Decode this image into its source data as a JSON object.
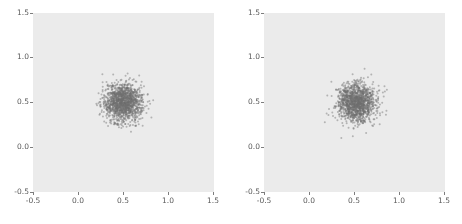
{
  "figure": {
    "background_color": "#ffffff",
    "width": 462,
    "height": 224,
    "layout": "1x2 side-by-side scatter subplots"
  },
  "chart_data": [
    {
      "type": "scatter",
      "title": "",
      "subtitle": "",
      "xlabel": "",
      "ylabel": "",
      "xlim": [
        -0.5,
        1.5
      ],
      "ylim": [
        -0.5,
        1.5
      ],
      "xticks": [
        -0.5,
        0.0,
        0.5,
        1.0,
        1.5
      ],
      "yticks": [
        -0.5,
        0.0,
        0.5,
        1.0,
        1.5
      ],
      "xticklabels": [
        "-0.5",
        "0.0",
        "0.5",
        "1.0",
        "1.5"
      ],
      "yticklabels": [
        "-0.5",
        "0.0",
        "0.5",
        "1.0",
        "1.5"
      ],
      "grid": false,
      "legend": null,
      "axes_facecolor": "#ebebeb",
      "marker_color": "#6e6e6e",
      "marker_size": 2,
      "marker_alpha": 0.45,
      "n_points": 1400,
      "distribution": "gaussian",
      "center": [
        0.5,
        0.5
      ],
      "std": [
        0.105,
        0.105
      ],
      "annotations": []
    },
    {
      "type": "scatter",
      "title": "",
      "subtitle": "",
      "xlabel": "",
      "ylabel": "",
      "xlim": [
        -0.5,
        1.5
      ],
      "ylim": [
        -0.5,
        1.5
      ],
      "xticks": [
        -0.5,
        0.0,
        0.5,
        1.0,
        1.5
      ],
      "yticks": [
        -0.5,
        0.0,
        0.5,
        1.0,
        1.5
      ],
      "xticklabels": [
        "-0.5",
        "0.0",
        "0.5",
        "1.0",
        "1.5"
      ],
      "yticklabels": [
        "-0.5",
        "0.0",
        "0.5",
        "1.0",
        "1.5"
      ],
      "grid": false,
      "legend": null,
      "axes_facecolor": "#ebebeb",
      "marker_color": "#6e6e6e",
      "marker_size": 2,
      "marker_alpha": 0.45,
      "n_points": 1400,
      "distribution": "gaussian",
      "center": [
        0.52,
        0.5
      ],
      "std": [
        0.105,
        0.105
      ],
      "annotations": []
    }
  ],
  "subplots": [
    {
      "name": "left-scatter-plot",
      "xticklabels": [
        "-0.5",
        "0.0",
        "0.5",
        "1.0",
        "1.5"
      ],
      "yticklabels": [
        "-0.5",
        "0.0",
        "0.5",
        "1.0",
        "1.5"
      ]
    },
    {
      "name": "right-scatter-plot",
      "xticklabels": [
        "-0.5",
        "0.0",
        "0.5",
        "1.0",
        "1.5"
      ],
      "yticklabels": [
        "-0.5",
        "0.0",
        "0.5",
        "1.0",
        "1.5"
      ]
    }
  ]
}
